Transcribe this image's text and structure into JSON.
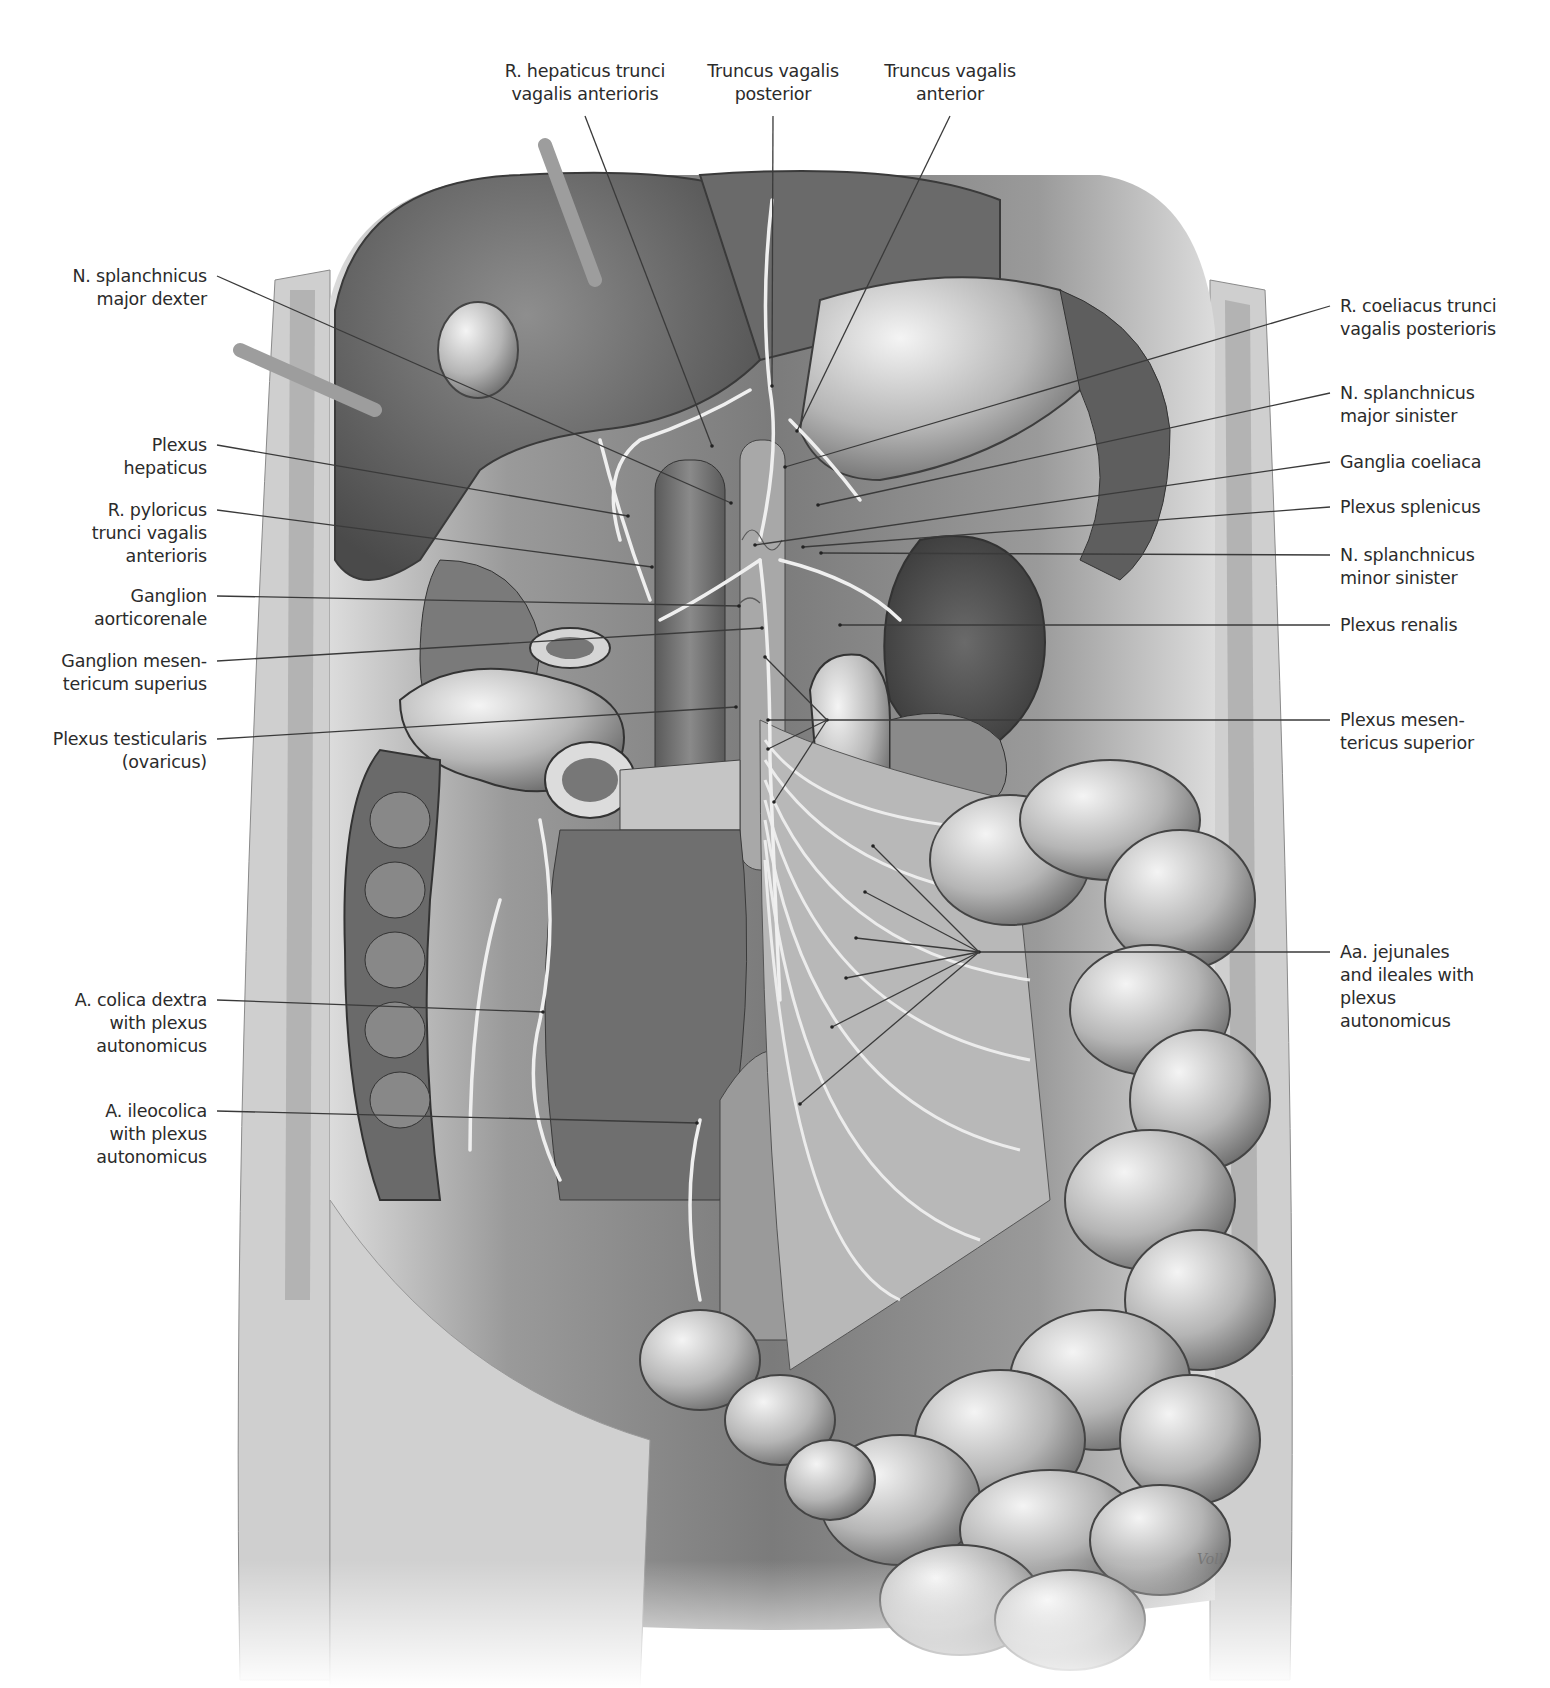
{
  "figure": {
    "type": "anatomical illustration",
    "signature": "Voll",
    "colors": {
      "background": "#ffffff",
      "label_text": "#2b2b2b",
      "leader_line": "#3a3a3a"
    }
  },
  "labels": {
    "top": [
      {
        "id": "r-hepaticus",
        "lines": [
          "R. hepaticus trunci",
          "vagalis anterioris"
        ],
        "x": 585,
        "y": 60,
        "target": [
          712,
          446
        ]
      },
      {
        "id": "truncus-vagalis-posterior",
        "lines": [
          "Truncus vagalis",
          "posterior"
        ],
        "x": 773,
        "y": 60,
        "target": [
          772,
          386
        ]
      },
      {
        "id": "truncus-vagalis-anterior",
        "lines": [
          "Truncus vagalis",
          "anterior"
        ],
        "x": 950,
        "y": 60,
        "target": [
          797,
          431
        ]
      }
    ],
    "left": [
      {
        "id": "n-splanchnicus-major-dexter",
        "lines": [
          "N. splanchnicus",
          "major dexter"
        ],
        "right": 207,
        "y": 276,
        "target": [
          731,
          503
        ]
      },
      {
        "id": "plexus-hepaticus",
        "lines": [
          "Plexus",
          "hepaticus"
        ],
        "right": 207,
        "y": 445,
        "target": [
          628,
          516
        ]
      },
      {
        "id": "r-pyloricus",
        "lines": [
          "R. pyloricus",
          "trunci vagalis",
          "anterioris"
        ],
        "right": 207,
        "y": 510,
        "target": [
          652,
          567
        ]
      },
      {
        "id": "ganglion-aorticorenale",
        "lines": [
          "Ganglion",
          "aorticorenale"
        ],
        "right": 207,
        "y": 596,
        "target": [
          739,
          606
        ]
      },
      {
        "id": "ganglion-mesentericum-superius",
        "lines": [
          "Ganglion mesen-",
          "tericum superius"
        ],
        "right": 207,
        "y": 661,
        "target": [
          762,
          628
        ]
      },
      {
        "id": "plexus-testicularis",
        "lines": [
          "Plexus testicularis",
          "(ovaricus)"
        ],
        "right": 207,
        "y": 739,
        "target": [
          736,
          707
        ]
      },
      {
        "id": "a-colica-dextra",
        "lines": [
          "A. colica dextra",
          "with plexus",
          "autonomicus"
        ],
        "right": 207,
        "y": 1000,
        "target": [
          543,
          1012
        ]
      },
      {
        "id": "a-ileocolica",
        "lines": [
          "A. ileocolica",
          "with plexus",
          "autonomicus"
        ],
        "right": 207,
        "y": 1111,
        "target": [
          697,
          1123
        ]
      }
    ],
    "right": [
      {
        "id": "r-coeliacus",
        "lines": [
          "R. coeliacus trunci",
          "vagalis posterioris"
        ],
        "left": 1340,
        "y": 306,
        "target": [
          785,
          467
        ]
      },
      {
        "id": "n-splanchnicus-major-sinister",
        "lines": [
          "N. splanchnicus",
          "major sinister"
        ],
        "left": 1340,
        "y": 393,
        "target": [
          818,
          505
        ]
      },
      {
        "id": "ganglia-coeliaca",
        "lines": [
          "Ganglia coeliaca"
        ],
        "left": 1340,
        "y": 462,
        "target": [
          755,
          545
        ]
      },
      {
        "id": "plexus-splenicus",
        "lines": [
          "Plexus splenicus"
        ],
        "left": 1340,
        "y": 507,
        "target": [
          803,
          547
        ]
      },
      {
        "id": "n-splanchnicus-minor-sinister",
        "lines": [
          "N. splanchnicus",
          "minor sinister"
        ],
        "left": 1340,
        "y": 555,
        "target": [
          821,
          553
        ]
      },
      {
        "id": "plexus-renalis",
        "lines": [
          "Plexus renalis"
        ],
        "left": 1340,
        "y": 625,
        "target": [
          840,
          625
        ]
      },
      {
        "id": "plexus-mesentericus-superior",
        "lines": [
          "Plexus mesen-",
          "tericus superior"
        ],
        "left": 1340,
        "y": 720,
        "target": [
          827,
          720
        ],
        "fan": [
          [
            765,
            657
          ],
          [
            768,
            720
          ],
          [
            768,
            749
          ],
          [
            774,
            802
          ]
        ]
      },
      {
        "id": "aa-jejunales-ileales",
        "lines": [
          "Aa. jejunales",
          "and ileales with",
          "plexus",
          "autonomicus"
        ],
        "left": 1340,
        "y": 952,
        "target": [
          979,
          952
        ],
        "fan": [
          [
            873,
            846
          ],
          [
            865,
            892
          ],
          [
            856,
            938
          ],
          [
            846,
            978
          ],
          [
            832,
            1027
          ],
          [
            800,
            1104
          ]
        ]
      }
    ]
  }
}
